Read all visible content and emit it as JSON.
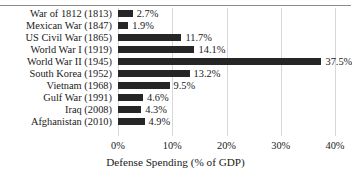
{
  "chart_data": {
    "type": "bar",
    "orientation": "horizontal",
    "title": "",
    "xlabel": "Defense Spending (% of GDP)",
    "ylabel": "",
    "xlim": [
      0,
      40
    ],
    "xticks": [
      "0%",
      "10%",
      "20%",
      "30%",
      "40%"
    ],
    "xtick_values": [
      0,
      10,
      20,
      30,
      40
    ],
    "grid": "vertical",
    "legend": "none",
    "bar_color": "#262626",
    "gridline_color": "#d7d7d7",
    "categories": [
      "War of 1812 (1813)",
      "Mexican War (1847)",
      "US Civil War (1865)",
      "World War I (1919)",
      "World War II (1945)",
      "South Korea (1952)",
      "Vietnam (1968)",
      "Gulf War (1991)",
      "Iraq (2008)",
      "Afghanistan (2010)"
    ],
    "values": [
      2.7,
      1.9,
      11.7,
      14.1,
      37.5,
      13.2,
      9.5,
      4.6,
      4.3,
      4.9
    ],
    "data_labels": [
      "2.7%",
      "1.9%",
      "11.7%",
      "14.1%",
      "37.5%",
      "13.2%",
      "9.5%",
      "4.6%",
      "4.3%",
      "4.9%"
    ]
  }
}
